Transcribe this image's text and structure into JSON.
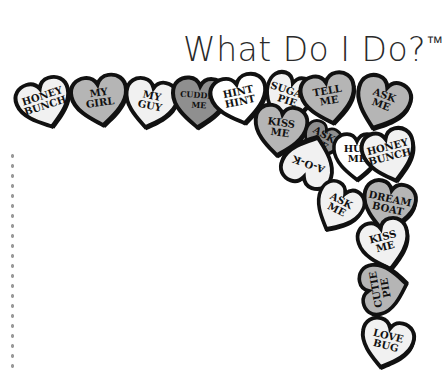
{
  "title": {
    "text": "What Do I Do?",
    "mark": "™"
  },
  "colors": {
    "outline": "#111111",
    "light": "#f1f1f1",
    "mid": "#b5b5b5",
    "dark": "#8f8f8f",
    "white": "#ffffff",
    "dots": "#9a9a9a"
  },
  "hearts": [
    {
      "l1": "HONEY",
      "l2": "BUNCH"
    },
    {
      "l1": "MY",
      "l2": "GIRL"
    },
    {
      "l1": "MY",
      "l2": "GUY"
    },
    {
      "l1": "CUDDLE",
      "l2": "ME"
    },
    {
      "l1": "HINT",
      "l2": "HINT"
    },
    {
      "l1": "SUGAR",
      "l2": "PIE"
    },
    {
      "l1": "TELL",
      "l2": "ME"
    },
    {
      "l1": "ASK",
      "l2": "ME"
    },
    {
      "l1": "KISS",
      "l2": "ME"
    },
    {
      "l1": "ASK",
      "l2": "ME"
    },
    {
      "l1": "A-O-K",
      "l2": ""
    },
    {
      "l1": "HUG",
      "l2": "ME"
    },
    {
      "l1": "HONEY",
      "l2": "BUNCH"
    },
    {
      "l1": "ASK",
      "l2": "ME"
    },
    {
      "l1": "DREAM",
      "l2": "BOAT"
    },
    {
      "l1": "KISS",
      "l2": "ME"
    },
    {
      "l1": "CUTIE",
      "l2": "PIE"
    },
    {
      "l1": "LOVE",
      "l2": "BUG"
    }
  ]
}
